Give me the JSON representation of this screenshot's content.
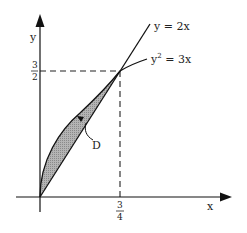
{
  "diagram": {
    "type": "region-between-curves",
    "axes": {
      "x_label": "x",
      "y_label": "y"
    },
    "curves": [
      {
        "id": "line",
        "label": "y = 2x"
      },
      {
        "id": "parabola",
        "label_base": "y",
        "label_exp": "2",
        "label_rest": " = 3x"
      }
    ],
    "intersection": {
      "x_tick": {
        "num": "3",
        "den": "4"
      },
      "y_tick": {
        "num": "3",
        "den": "2"
      }
    },
    "region": {
      "label": "D",
      "fill": "#a9a9a9"
    },
    "colors": {
      "stroke": "#111111",
      "dashed": "#222222",
      "background": "#ffffff"
    }
  }
}
